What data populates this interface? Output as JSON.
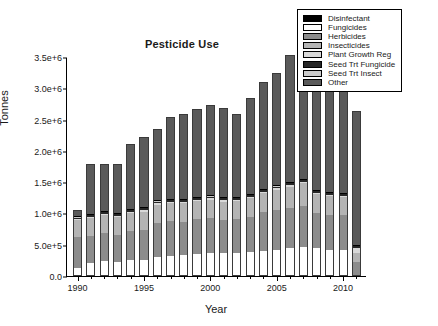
{
  "chart_data": {
    "type": "bar",
    "stacked": true,
    "title": "Pesticide Use",
    "xlabel": "Year",
    "ylabel": "Tonnes",
    "grid": false,
    "legend_position": "top-right",
    "ylim": [
      0,
      3500000
    ],
    "ytick_values": [
      0,
      500000,
      1000000,
      1500000,
      2000000,
      2500000,
      3000000,
      3500000
    ],
    "ytick_labels": [
      "0.0",
      "5.0e+5",
      "1.0e+6",
      "1.5e+6",
      "2.0e+6",
      "2.5e+6",
      "3.0e+6",
      "3.5e+6"
    ],
    "xlim": [
      1989.2,
      2011.8
    ],
    "xtick_major_values": [
      1990,
      1995,
      2000,
      2005,
      2010
    ],
    "xtick_major_labels": [
      "1990",
      "1995",
      "2000",
      "2005",
      "2010"
    ],
    "categories": [
      1990,
      1991,
      1992,
      1993,
      1994,
      1995,
      1996,
      1997,
      1998,
      1999,
      2000,
      2001,
      2002,
      2003,
      2004,
      2005,
      2006,
      2007,
      2008,
      2009,
      2010,
      2011
    ],
    "series": [
      {
        "name": "Fungicides",
        "color": "#ffffff",
        "values": [
          120000,
          210000,
          240000,
          230000,
          250000,
          260000,
          300000,
          320000,
          330000,
          350000,
          360000,
          370000,
          370000,
          390000,
          400000,
          420000,
          440000,
          460000,
          450000,
          410000,
          410000,
          0
        ]
      },
      {
        "name": "Herbicides",
        "color": "#8c8c8c",
        "values": [
          500000,
          430000,
          450000,
          430000,
          470000,
          480000,
          540000,
          560000,
          540000,
          560000,
          560000,
          520000,
          540000,
          560000,
          620000,
          630000,
          650000,
          660000,
          560000,
          570000,
          560000,
          230000
        ]
      },
      {
        "name": "Insecticides",
        "color": "#b4b4b4",
        "values": [
          270000,
          280000,
          280000,
          280000,
          280000,
          290000,
          300000,
          290000,
          290000,
          290000,
          300000,
          300000,
          290000,
          300000,
          310000,
          330000,
          340000,
          360000,
          300000,
          300000,
          290000,
          140000
        ]
      },
      {
        "name": "Plant Growth Reg",
        "color": "#d9d9d9",
        "values": [
          20000,
          20000,
          20000,
          20000,
          20000,
          20000,
          20000,
          20000,
          20000,
          20000,
          20000,
          20000,
          20000,
          20000,
          20000,
          20000,
          20000,
          20000,
          20000,
          20000,
          20000,
          80000
        ]
      },
      {
        "name": "Seed Trt Fungicide",
        "color": "#262626",
        "values": [
          35000,
          40000,
          40000,
          40000,
          40000,
          40000,
          40000,
          40000,
          40000,
          40000,
          40000,
          40000,
          40000,
          40000,
          40000,
          40000,
          40000,
          40000,
          40000,
          40000,
          40000,
          40000
        ]
      },
      {
        "name": "Seed Trt Insect",
        "color": "#cccccc",
        "values": [
          5000,
          5000,
          5000,
          5000,
          5000,
          5000,
          5000,
          5000,
          5000,
          5000,
          5000,
          5000,
          5000,
          5000,
          5000,
          5000,
          5000,
          5000,
          5000,
          5000,
          5000,
          5000
        ]
      },
      {
        "name": "Disinfectant",
        "color": "#000000",
        "values": [
          2000,
          2000,
          2000,
          2000,
          2000,
          2000,
          2000,
          2000,
          2000,
          2000,
          2000,
          2000,
          2000,
          2000,
          2000,
          2000,
          2000,
          2000,
          2000,
          2000,
          2000,
          2000
        ]
      },
      {
        "name": "Other",
        "color": "#5a5a5a",
        "values": [
          98000,
          810000,
          760000,
          790000,
          1050000,
          1130000,
          1140000,
          1300000,
          1370000,
          1400000,
          1440000,
          1420000,
          1330000,
          1530000,
          1700000,
          1800000,
          2030000,
          2080000,
          1800000,
          1620000,
          1670000,
          2140000
        ]
      }
    ],
    "totals": [
      1050000,
      1797000,
      1797000,
      1797000,
      2117000,
      2227000,
      2347000,
      2537000,
      2597000,
      2667000,
      2727000,
      2677000,
      2597000,
      2847000,
      3097000,
      3247000,
      3527000,
      3627000,
      3177000,
      2967000,
      2997000,
      2637000
    ]
  },
  "legend": {
    "items": [
      {
        "label": "Disinfectant",
        "color": "#000000"
      },
      {
        "label": "Fungicides",
        "color": "#ffffff"
      },
      {
        "label": "Herbicides",
        "color": "#8c8c8c"
      },
      {
        "label": "Insecticides",
        "color": "#b4b4b4"
      },
      {
        "label": "Plant Growth Reg",
        "color": "#d9d9d9"
      },
      {
        "label": "Seed Trt Fungicide",
        "color": "#262626"
      },
      {
        "label": "Seed Trt Insect",
        "color": "#cccccc"
      },
      {
        "label": "Other",
        "color": "#5a5a5a"
      }
    ]
  }
}
